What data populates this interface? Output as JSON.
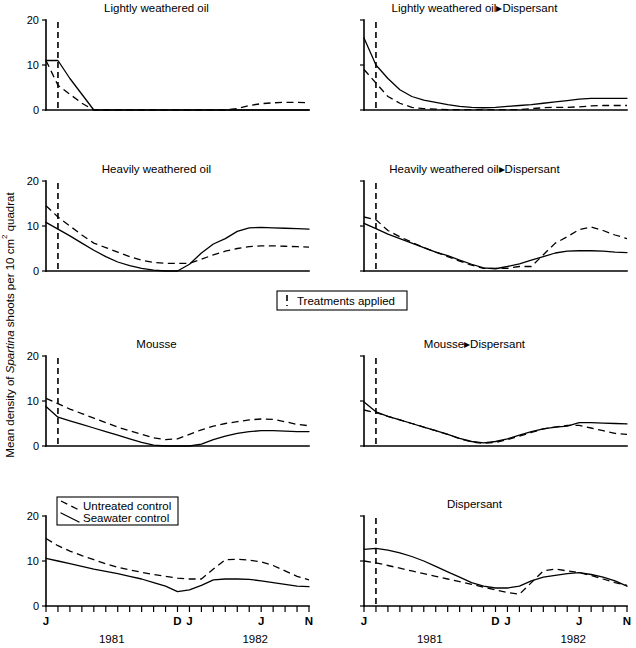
{
  "figure": {
    "ylabel": "Mean density of Spartina shoots per 10 cm2 quadrat",
    "ylabel_parts": {
      "pre": "Mean density of ",
      "italic": "Spartina",
      "post": " shoots per 10 cm",
      "sup": "2",
      "tail": " quadrat"
    },
    "y_ticks": [
      "0",
      "10",
      "20"
    ],
    "y_tick_values": [
      0,
      10,
      20
    ],
    "ylim": [
      0,
      20
    ],
    "x_tick_labels": [
      {
        "index": 0,
        "label": "J"
      },
      {
        "index": 11,
        "label": "D"
      },
      {
        "index": 12,
        "label": "J"
      },
      {
        "index": 18,
        "label": "J"
      },
      {
        "index": 22,
        "label": "N"
      }
    ],
    "year_labels": [
      {
        "text": "1981",
        "index": 5.5
      },
      {
        "text": "1982",
        "index": 17.5
      }
    ],
    "n_x_ticks": 23,
    "treatment_marker_index": 1,
    "treatment_legend": {
      "label": "Treatments applied"
    },
    "series_legend": [
      {
        "label": "Untreated control",
        "style": "dashed"
      },
      {
        "label": "Seawater control",
        "style": "solid"
      }
    ]
  },
  "chart_data": {
    "type": "line",
    "xlabel": "",
    "ylabel": "Mean density of Spartina shoots per 10 cm2 quadrat",
    "ylim": [
      0,
      20
    ],
    "grid": false,
    "legend_position": "inset-row4-left",
    "x": [
      "J 1981",
      "F 1981",
      "M 1981",
      "A 1981",
      "M 1981",
      "J 1981",
      "J 1981",
      "A 1981",
      "S 1981",
      "O 1981",
      "N 1981",
      "D 1981",
      "J 1982",
      "F 1982",
      "M 1982",
      "A 1982",
      "M 1982",
      "J 1982",
      "J 1982",
      "A 1982",
      "S 1982",
      "O 1982",
      "N 1982"
    ],
    "x_tick_labels": [
      "J",
      "",
      "",
      "",
      "",
      "",
      "",
      "",
      "",
      "",
      "",
      "D",
      "J",
      "",
      "",
      "",
      "",
      "",
      "J",
      "",
      "",
      "",
      "N"
    ],
    "panels": [
      {
        "id": "lightly-weathered-oil",
        "title": "Lightly weathered oil",
        "row": 1,
        "col": 1,
        "series": [
          {
            "name": "Untreated control",
            "style": "dashed",
            "values": [
              11.0,
              5.5,
              3.5,
              1.5,
              0,
              0,
              0,
              0,
              0,
              0,
              0,
              0,
              0,
              0,
              0,
              0,
              0.3,
              1.0,
              1.4,
              1.6,
              1.7,
              1.7,
              1.6
            ]
          },
          {
            "name": "Seawater control",
            "style": "solid",
            "values": [
              11.0,
              11.0,
              7.0,
              3.5,
              0,
              0,
              0,
              0,
              0,
              0,
              0,
              0,
              0,
              0,
              0,
              0,
              0,
              0,
              0,
              0,
              0,
              0,
              0
            ]
          }
        ]
      },
      {
        "id": "lightly-weathered-oil-dispersant",
        "title": "Lightly weathered oil▸Dispersant",
        "row": 1,
        "col": 2,
        "series": [
          {
            "name": "Untreated control",
            "style": "dashed",
            "values": [
              9.0,
              6.0,
              3.0,
              1.5,
              0.6,
              0.3,
              0.2,
              0.1,
              0.1,
              0.1,
              0.1,
              0.1,
              0.1,
              0.1,
              0.3,
              0.5,
              0.6,
              0.6,
              0.7,
              0.9,
              1.0,
              1.0,
              1.0
            ]
          },
          {
            "name": "Seawater control",
            "style": "solid",
            "values": [
              16.0,
              10.0,
              7.0,
              4.5,
              3.0,
              2.2,
              1.7,
              1.2,
              0.8,
              0.6,
              0.5,
              0.6,
              0.8,
              1.0,
              1.2,
              1.5,
              1.8,
              2.1,
              2.4,
              2.6,
              2.6,
              2.6,
              2.6
            ]
          }
        ]
      },
      {
        "id": "heavily-weathered-oil",
        "title": "Heavily weathered oil",
        "row": 2,
        "col": 1,
        "series": [
          {
            "name": "Untreated control",
            "style": "dashed",
            "values": [
              14.5,
              12.0,
              10.0,
              8.0,
              6.2,
              5.2,
              4.2,
              3.2,
              2.4,
              1.9,
              1.7,
              1.7,
              1.7,
              2.6,
              3.6,
              4.4,
              5.0,
              5.4,
              5.6,
              5.6,
              5.5,
              5.4,
              5.3
            ]
          },
          {
            "name": "Seawater control",
            "style": "solid",
            "values": [
              10.8,
              9.3,
              7.8,
              6.2,
              4.6,
              3.2,
              2.0,
              1.2,
              0.6,
              0.2,
              0.0,
              0.0,
              1.5,
              4.0,
              6.0,
              7.2,
              8.8,
              9.6,
              9.7,
              9.6,
              9.5,
              9.4,
              9.3
            ]
          }
        ]
      },
      {
        "id": "heavily-weathered-oil-dispersant",
        "title": "Heavily weathered oil▸Dispersant",
        "row": 2,
        "col": 2,
        "series": [
          {
            "name": "Untreated control",
            "style": "dashed",
            "values": [
              12.0,
              11.4,
              9.0,
              7.6,
              6.4,
              5.2,
              4.2,
              3.2,
              2.2,
              1.3,
              0.6,
              0.6,
              0.6,
              1.0,
              1.0,
              3.6,
              6.2,
              7.6,
              9.2,
              9.8,
              9.0,
              8.0,
              7.2
            ]
          },
          {
            "name": "Seawater control",
            "style": "solid",
            "values": [
              10.6,
              9.4,
              8.2,
              7.2,
              6.2,
              5.2,
              4.2,
              3.4,
              2.4,
              1.5,
              0.7,
              0.5,
              1.0,
              1.6,
              2.4,
              3.2,
              4.0,
              4.4,
              4.5,
              4.5,
              4.4,
              4.2,
              4.1
            ]
          }
        ]
      },
      {
        "id": "mousse",
        "title": "Mousse",
        "row": 3,
        "col": 1,
        "series": [
          {
            "name": "Untreated control",
            "style": "dashed",
            "values": [
              10.6,
              9.4,
              8.2,
              7.2,
              6.2,
              5.2,
              4.2,
              3.4,
              2.6,
              1.8,
              1.4,
              1.6,
              2.6,
              3.6,
              4.4,
              5.0,
              5.4,
              5.8,
              6.0,
              5.9,
              5.4,
              4.8,
              4.5
            ]
          },
          {
            "name": "Seawater control",
            "style": "solid",
            "values": [
              8.8,
              6.4,
              5.6,
              4.8,
              4.0,
              3.2,
              2.4,
              1.6,
              0.8,
              0.2,
              0.0,
              0.0,
              0.0,
              0.4,
              1.4,
              2.2,
              2.8,
              3.2,
              3.4,
              3.4,
              3.3,
              3.2,
              3.2
            ]
          }
        ]
      },
      {
        "id": "mousse-dispersant",
        "title": "Mousse▸Dispersant",
        "row": 3,
        "col": 2,
        "series": [
          {
            "name": "Untreated control",
            "style": "dashed",
            "values": [
              8.0,
              7.4,
              6.6,
              5.8,
              5.0,
              4.2,
              3.4,
              2.6,
              1.6,
              0.9,
              0.6,
              0.8,
              1.4,
              2.2,
              3.0,
              3.8,
              4.2,
              4.6,
              4.6,
              4.0,
              3.4,
              2.8,
              2.6
            ]
          },
          {
            "name": "Seawater control",
            "style": "solid",
            "values": [
              9.8,
              7.6,
              6.6,
              5.8,
              5.0,
              4.2,
              3.4,
              2.6,
              1.7,
              1.0,
              0.7,
              1.0,
              1.6,
              2.4,
              3.2,
              3.8,
              4.2,
              4.4,
              5.2,
              5.2,
              5.1,
              5.0,
              4.9
            ]
          }
        ]
      },
      {
        "id": "untreated-seawater-controls",
        "title": "",
        "row": 4,
        "col": 1,
        "has_series_legend": true,
        "has_treatment_marker": false,
        "series": [
          {
            "name": "Untreated control",
            "style": "dashed",
            "values": [
              15.0,
              13.4,
              12.2,
              11.2,
              10.3,
              9.4,
              8.6,
              8.0,
              7.5,
              7.0,
              6.6,
              6.2,
              6.0,
              6.0,
              8.2,
              10.3,
              10.4,
              10.2,
              9.8,
              9.0,
              7.8,
              6.6,
              5.8
            ]
          },
          {
            "name": "Seawater control",
            "style": "solid",
            "values": [
              10.6,
              10.0,
              9.4,
              8.8,
              8.2,
              7.7,
              7.2,
              6.6,
              6.0,
              5.2,
              4.4,
              3.2,
              3.6,
              4.6,
              5.8,
              6.0,
              6.0,
              5.9,
              5.6,
              5.2,
              4.8,
              4.4,
              4.3
            ]
          }
        ]
      },
      {
        "id": "dispersant",
        "title": "Dispersant",
        "row": 4,
        "col": 2,
        "series": [
          {
            "name": "Untreated control",
            "style": "dashed",
            "values": [
              10.0,
              9.6,
              9.0,
              8.4,
              7.8,
              7.2,
              6.6,
              6.0,
              5.4,
              4.8,
              4.2,
              3.6,
              3.0,
              2.6,
              5.2,
              7.8,
              8.2,
              7.8,
              7.4,
              6.8,
              6.0,
              5.2,
              4.6
            ]
          },
          {
            "name": "Seawater control",
            "style": "solid",
            "values": [
              12.6,
              12.8,
              12.4,
              11.8,
              11.0,
              10.0,
              8.8,
              7.6,
              6.4,
              5.2,
              4.4,
              4.0,
              4.0,
              4.4,
              5.6,
              6.4,
              6.8,
              7.2,
              7.4,
              7.0,
              6.4,
              5.6,
              4.4
            ]
          }
        ]
      }
    ]
  }
}
